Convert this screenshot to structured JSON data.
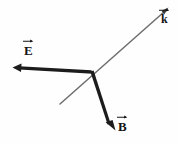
{
  "figure": {
    "name": "electromagnetic-wave-vector-triad",
    "background_color": "#fefefe",
    "width": 178,
    "height": 143,
    "origin": {
      "x": 92,
      "y": 72
    }
  },
  "vectors": [
    {
      "id": "E",
      "symbol": "E",
      "name": "electric-field-vector",
      "has_overarrow": true,
      "color": "#1c1c1c",
      "stroke_width": 2.6,
      "tail": {
        "x": 92,
        "y": 72
      },
      "tip": {
        "x": 13,
        "y": 67
      },
      "label_position": {
        "x": 24,
        "y": 44
      },
      "direction": "left",
      "arrowhead": "filled"
    },
    {
      "id": "B",
      "symbol": "B",
      "name": "magnetic-field-vector",
      "has_overarrow": true,
      "color": "#1c1c1c",
      "stroke_width": 2.6,
      "tail": {
        "x": 92,
        "y": 72
      },
      "tip": {
        "x": 115,
        "y": 130
      },
      "label_position": {
        "x": 118,
        "y": 120
      },
      "direction": "down-right",
      "arrowhead": "filled"
    },
    {
      "id": "k",
      "symbol": "k",
      "name": "wave-vector",
      "has_overarrow": true,
      "color": "#6e6e6e",
      "stroke_width": 1.5,
      "tail": {
        "x": 60,
        "y": 104
      },
      "tip": {
        "x": 168,
        "y": 8
      },
      "label_position": {
        "x": 161,
        "y": 12
      },
      "direction": "up-right",
      "arrowhead": "filled",
      "note": "line passes through origin and extends below-left as a bare tail"
    }
  ],
  "labels": {
    "E": "E",
    "B": "B",
    "k": "k"
  },
  "colors": {
    "ink": "#1c1c1c",
    "gray_line": "#6e6e6e",
    "background": "#fefefe"
  }
}
